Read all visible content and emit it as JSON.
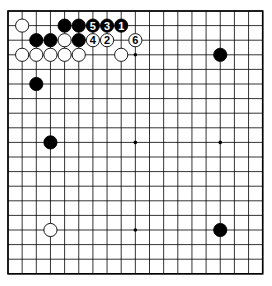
{
  "board": {
    "size": 19,
    "origin": {
      "x": 8,
      "y": 11
    },
    "spacing": {
      "x": 14.15,
      "y": 14.6
    },
    "stone_radius": 6.6,
    "colors": {
      "background": "#ffffff",
      "line": "#000000",
      "black": "#000000",
      "white": "#ffffff"
    }
  },
  "star_points": [
    {
      "col": 9,
      "row": 3
    },
    {
      "col": 3,
      "row": 9
    },
    {
      "col": 9,
      "row": 9
    },
    {
      "col": 15,
      "row": 9
    },
    {
      "col": 9,
      "row": 15
    }
  ],
  "stones": [
    {
      "col": 1,
      "row": 1,
      "color": "white",
      "label": ""
    },
    {
      "col": 4,
      "row": 1,
      "color": "black",
      "label": ""
    },
    {
      "col": 5,
      "row": 1,
      "color": "black",
      "label": ""
    },
    {
      "col": 6,
      "row": 1,
      "color": "black",
      "label": "5"
    },
    {
      "col": 7,
      "row": 1,
      "color": "black",
      "label": "3"
    },
    {
      "col": 8,
      "row": 1,
      "color": "black",
      "label": "1"
    },
    {
      "col": 2,
      "row": 2,
      "color": "black",
      "label": ""
    },
    {
      "col": 3,
      "row": 2,
      "color": "black",
      "label": ""
    },
    {
      "col": 4,
      "row": 2,
      "color": "white",
      "label": ""
    },
    {
      "col": 5,
      "row": 2,
      "color": "black",
      "label": ""
    },
    {
      "col": 6,
      "row": 2,
      "color": "white",
      "label": "4"
    },
    {
      "col": 7,
      "row": 2,
      "color": "white",
      "label": "2"
    },
    {
      "col": 9,
      "row": 2,
      "color": "white",
      "label": "6"
    },
    {
      "col": 1,
      "row": 3,
      "color": "white",
      "label": ""
    },
    {
      "col": 2,
      "row": 3,
      "color": "white",
      "label": ""
    },
    {
      "col": 3,
      "row": 3,
      "color": "white",
      "label": ""
    },
    {
      "col": 4,
      "row": 3,
      "color": "white",
      "label": ""
    },
    {
      "col": 5,
      "row": 3,
      "color": "white",
      "label": ""
    },
    {
      "col": 8,
      "row": 3,
      "color": "white",
      "label": ""
    },
    {
      "col": 15,
      "row": 3,
      "color": "black",
      "label": ""
    },
    {
      "col": 2,
      "row": 5,
      "color": "black",
      "label": ""
    },
    {
      "col": 3,
      "row": 9,
      "color": "black",
      "label": ""
    },
    {
      "col": 3,
      "row": 15,
      "color": "white",
      "label": ""
    },
    {
      "col": 15,
      "row": 15,
      "color": "black",
      "label": ""
    }
  ]
}
